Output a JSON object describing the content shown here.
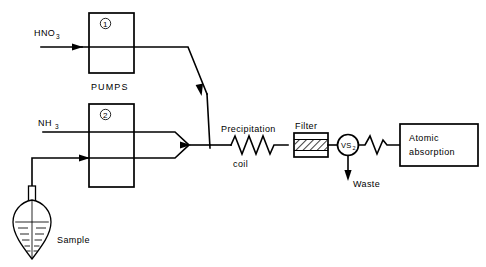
{
  "figure": {
    "background_color": "#ffffff",
    "line_color": "#000000"
  },
  "reagents": {
    "nitric_acid": {
      "label": "HNO",
      "subscript": "3"
    },
    "ammonia": {
      "label": "NH",
      "subscript": "3"
    }
  },
  "pumps": {
    "group_label": "PUMPS",
    "pump_one_label": "1",
    "pump_two_label": "2"
  },
  "sample": {
    "label": "Sample"
  },
  "modules": {
    "precipitation_coil": {
      "line1": "Precipitation",
      "line2": "coil"
    },
    "filter": {
      "label": "Filter"
    },
    "valve": {
      "label": "VS",
      "subscript": "2"
    },
    "waste": {
      "label": "Waste"
    },
    "detector": {
      "line1": "Atomic",
      "line2": "absorption"
    }
  }
}
